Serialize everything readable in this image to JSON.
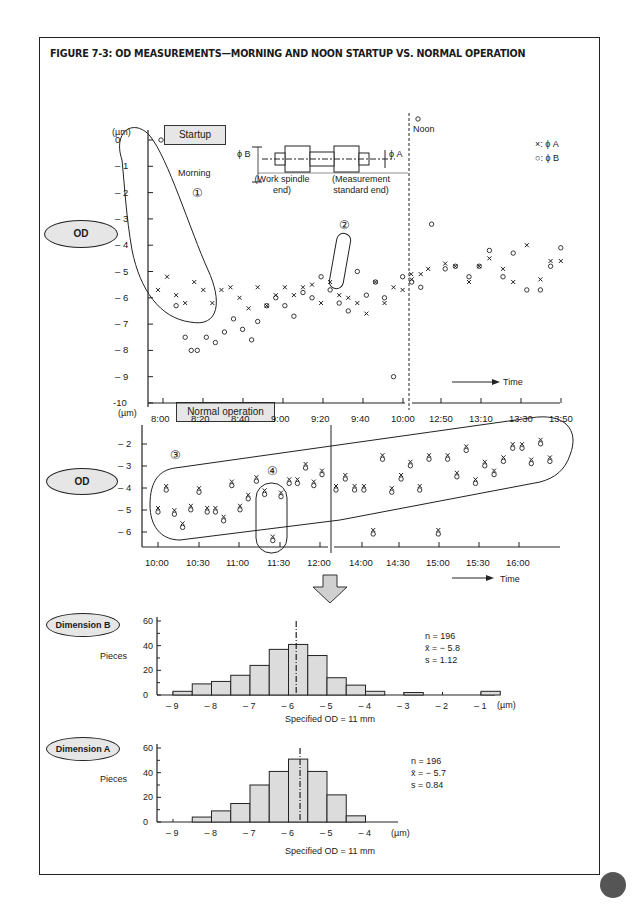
{
  "figure": {
    "title": "FIGURE 7-3: OD MEASUREMENTS—MORNING AND NOON STARTUP VS. NORMAL OPERATION"
  },
  "labels": {
    "od_top": "OD",
    "od_mid": "OD",
    "dim_b": "Dimension B",
    "dim_a": "Dimension A",
    "startup_box": "Startup",
    "normal_box": "Normal operation",
    "unit_top": "(µm)",
    "unit_mid": "(µm)",
    "morning": "Morning",
    "noon": "Noon",
    "legend_x": "×: ϕ A",
    "legend_o": "○: ϕ B",
    "phi_b": "ϕ B",
    "phi_a": "ϕ A",
    "work_end_1": "(Work spindle",
    "work_end_2": "end)",
    "meas_end_1": "(Measurement",
    "meas_end_2": "standard end)",
    "time_top": "Time",
    "time_mid": "Time",
    "circle_1": "①",
    "circle_2": "②",
    "circle_3": "③",
    "circle_4": "④",
    "pieces_b": "Pieces",
    "pieces_a": "Pieces",
    "spec_b": "Specified OD = 11 mm",
    "spec_a": "Specified OD = 11 mm",
    "unit_b": "(µm)",
    "unit_a": "(µm)",
    "stats_b_n": "n = 196",
    "stats_b_x": "x̄ = − 5.8",
    "stats_b_s": "s = 1.12",
    "stats_a_n": "n = 196",
    "stats_a_x": "x̄ = − 5.7",
    "stats_a_s": "s = 0.84"
  },
  "chart_data": [
    {
      "type": "scatter",
      "title": "Startup",
      "ylabel": "OD (µm)",
      "xlabel": "Time",
      "ylim": [
        -10,
        0.5
      ],
      "yticks": [
        "0",
        "1",
        "2",
        "3",
        "4",
        "5",
        "6",
        "7",
        "8",
        "9",
        "-10"
      ],
      "xticks": [
        "8:00",
        "8:20",
        "8:40",
        "9:00",
        "9:20",
        "9:40",
        "10:00",
        "12:50",
        "13:10",
        "13:30",
        "13:50"
      ],
      "annotations": [
        "Morning ①",
        "②",
        "Noon"
      ],
      "series": [
        {
          "name": "ϕ A (×)",
          "points": [
            [
              0,
              -5.7
            ],
            [
              3,
              -5.2
            ],
            [
              6,
              -5.9
            ],
            [
              9,
              -6.2
            ],
            [
              12,
              -5.4
            ],
            [
              15,
              -5.7
            ],
            [
              18,
              -6.2
            ],
            [
              21,
              -5.7
            ],
            [
              24,
              -5.6
            ],
            [
              27,
              -6.0
            ],
            [
              30,
              -6.4
            ],
            [
              33,
              -5.6
            ],
            [
              36,
              -6.3
            ],
            [
              39,
              -5.9
            ],
            [
              42,
              -5.6
            ],
            [
              45,
              -5.9
            ],
            [
              48,
              -5.6
            ],
            [
              51,
              -5.5
            ],
            [
              54,
              -6.2
            ],
            [
              57,
              -5.4
            ],
            [
              60,
              -5.9
            ],
            [
              63,
              -6.0
            ],
            [
              66,
              -6.2
            ],
            [
              69,
              -6.6
            ],
            [
              72,
              -5.4
            ],
            [
              75,
              -6.2
            ],
            [
              78,
              -5.6
            ],
            [
              81,
              -5.7
            ],
            [
              84,
              -5.3
            ],
            [
              87,
              -5.1
            ],
            [
              90,
              -5.1
            ],
            [
              95,
              -4.9
            ],
            [
              100,
              -4.7
            ],
            [
              103,
              -4.8
            ],
            [
              107,
              -5.4
            ],
            [
              110,
              -4.8
            ],
            [
              113,
              -4.5
            ],
            [
              117,
              -4.9
            ],
            [
              120,
              -5.4
            ],
            [
              124,
              -4.0
            ],
            [
              128,
              -5.3
            ],
            [
              131,
              -4.6
            ],
            [
              134,
              -4.6
            ]
          ]
        },
        {
          "name": "ϕ B (○)",
          "points": [
            [
              1,
              0.0
            ],
            [
              6,
              -6.3
            ],
            [
              9,
              -7.5
            ],
            [
              11,
              -8.0
            ],
            [
              13,
              -8.0
            ],
            [
              16,
              -7.5
            ],
            [
              19,
              -7.7
            ],
            [
              22,
              -7.3
            ],
            [
              25,
              -6.8
            ],
            [
              28,
              -7.2
            ],
            [
              31,
              -7.6
            ],
            [
              33,
              -6.9
            ],
            [
              36,
              -6.3
            ],
            [
              39,
              -6.0
            ],
            [
              42,
              -6.3
            ],
            [
              45,
              -6.7
            ],
            [
              48,
              -5.8
            ],
            [
              51,
              -6.0
            ],
            [
              54,
              -5.2
            ],
            [
              57,
              -5.7
            ],
            [
              60,
              -6.2
            ],
            [
              63,
              -6.5
            ],
            [
              66,
              -5.0
            ],
            [
              69,
              -5.9
            ],
            [
              72,
              -5.4
            ],
            [
              75,
              -6.0
            ],
            [
              78,
              -9.0
            ],
            [
              81,
              -5.2
            ],
            [
              84,
              -5.4
            ],
            [
              87,
              -5.6
            ],
            [
              92,
              0.8
            ],
            [
              96,
              -3.2
            ],
            [
              100,
              -4.9
            ],
            [
              103,
              -4.8
            ],
            [
              107,
              -5.2
            ],
            [
              110,
              -4.8
            ],
            [
              113,
              -4.2
            ],
            [
              117,
              -5.2
            ],
            [
              120,
              -4.3
            ],
            [
              124,
              -5.7
            ],
            [
              128,
              -5.7
            ],
            [
              131,
              -4.8
            ],
            [
              134,
              -4.1
            ]
          ]
        }
      ]
    },
    {
      "type": "scatter",
      "title": "Normal operation",
      "ylabel": "OD (µm)",
      "xlabel": "Time",
      "yticks": [
        "2",
        "3",
        "4",
        "5",
        "6"
      ],
      "xticks": [
        "10:00",
        "10:30",
        "11:00",
        "11:30",
        "12:00",
        "14:00",
        "14:30",
        "15:00",
        "15:30",
        "16:00"
      ],
      "annotations": [
        "③",
        "④"
      ],
      "series": [
        {
          "name": "ϕ A/ϕ B pairs",
          "points": [
            [
              0,
              -5.0
            ],
            [
              1,
              -4.0
            ],
            [
              2,
              -5.1
            ],
            [
              3,
              -5.7
            ],
            [
              4,
              -4.9
            ],
            [
              5,
              -4.1
            ],
            [
              6,
              -5.0
            ],
            [
              7,
              -5.0
            ],
            [
              8,
              -5.4
            ],
            [
              9,
              -3.8
            ],
            [
              10,
              -4.9
            ],
            [
              11,
              -4.4
            ],
            [
              12,
              -3.6
            ],
            [
              13,
              -4.2
            ],
            [
              14,
              -6.3
            ],
            [
              15,
              -4.3
            ],
            [
              16,
              -3.7
            ],
            [
              17,
              -3.7
            ],
            [
              18,
              -3.0
            ],
            [
              19,
              -3.8
            ],
            [
              20,
              -3.3
            ],
            [
              21,
              -4.0
            ],
            [
              22,
              -3.5
            ],
            [
              23,
              -4.0
            ],
            [
              24,
              -4.0
            ],
            [
              25,
              -6.0
            ],
            [
              26,
              -2.6
            ],
            [
              27,
              -4.1
            ],
            [
              28,
              -3.5
            ],
            [
              29,
              -2.9
            ],
            [
              30,
              -4.0
            ],
            [
              31,
              -2.6
            ],
            [
              32,
              -6.0
            ],
            [
              33,
              -2.6
            ],
            [
              34,
              -3.4
            ],
            [
              35,
              -2.2
            ],
            [
              36,
              -3.7
            ],
            [
              37,
              -2.9
            ],
            [
              38,
              -3.3
            ],
            [
              39,
              -2.7
            ],
            [
              40,
              -2.1
            ],
            [
              41,
              -2.1
            ],
            [
              42,
              -2.8
            ],
            [
              43,
              -1.9
            ],
            [
              44,
              -2.7
            ]
          ]
        }
      ]
    },
    {
      "type": "bar",
      "title": "Dimension B",
      "xlabel": "Specified OD = 11 mm",
      "ylabel": "Pieces",
      "ylim": [
        0,
        60
      ],
      "categories": [
        "-8.75",
        "-8.25",
        "-7.75",
        "-7.25",
        "-6.75",
        "-6.25",
        "-5.75",
        "-5.25",
        "-4.75",
        "-4.25",
        "-3.75",
        "-3.25",
        "-2.75",
        "-2.25",
        "-1.75",
        "-1.25",
        "-0.75"
      ],
      "values": [
        3,
        9,
        11,
        16,
        24,
        37,
        41,
        32,
        14,
        8,
        3,
        0,
        2,
        0,
        0,
        0,
        3
      ],
      "xticks": [
        "-9",
        "-8",
        "-7",
        "-6",
        "-5",
        "-4",
        "-3",
        "-2",
        "-1"
      ],
      "mean_line": -5.8,
      "stats": {
        "n": 196,
        "mean": -5.8,
        "s": 1.12
      }
    },
    {
      "type": "bar",
      "title": "Dimension A",
      "xlabel": "Specified OD = 11 mm",
      "ylabel": "Pieces",
      "ylim": [
        0,
        60
      ],
      "categories": [
        "-8.25",
        "-7.75",
        "-7.25",
        "-6.75",
        "-6.25",
        "-5.75",
        "-5.25",
        "-4.75",
        "-4.25"
      ],
      "values": [
        4,
        9,
        15,
        30,
        41,
        51,
        41,
        22,
        5
      ],
      "xticks": [
        "-9",
        "-8",
        "-7",
        "-6",
        "-5",
        "-4"
      ],
      "mean_line": -5.7,
      "stats": {
        "n": 196,
        "mean": -5.7,
        "s": 0.84
      }
    }
  ]
}
